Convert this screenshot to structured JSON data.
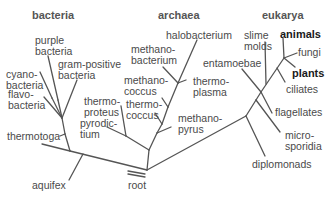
{
  "headers": {
    "bacteria": "bacteria",
    "archaea": "archaea",
    "eukarya": "eukarya"
  },
  "bacteria": {
    "purple": "purple\nbacteria",
    "gram_positive": "gram-positive\nbacteria",
    "cyanobacteria": "cyano-\nbacteria",
    "flavobacteria": "flavo-\nbacteria",
    "thermotoga": "thermotoga",
    "aquifex": "aquifex"
  },
  "archaea": {
    "halobacterium": "halobacterium",
    "methanobacterium": "methano-\nbacterium",
    "methanococcus": "methano-\ncoccus",
    "thermoplasma": "thermo-\nplasma",
    "thermoproteus": "thermo-\nproteus",
    "thermococcus": "thermo-\ncoccus",
    "pyrodictium": "pyrodic-\ntium",
    "methanopyrus": "methano-\npyrus"
  },
  "eukarya": {
    "slime_molds": "slime\nmolds",
    "animals": "animals",
    "fungi": "fungi",
    "entamoebae": "entamoebae",
    "plants": "plants",
    "ciliates": "ciliates",
    "flagellates": "flagellates",
    "microsporidia": "micro-\nsporidia",
    "diplomonads": "diplomonads"
  },
  "root": "root",
  "colors": {
    "line": "#555555",
    "text": "#4a4a4a",
    "bold_text": "#1a1a1a",
    "background": "#ffffff"
  }
}
